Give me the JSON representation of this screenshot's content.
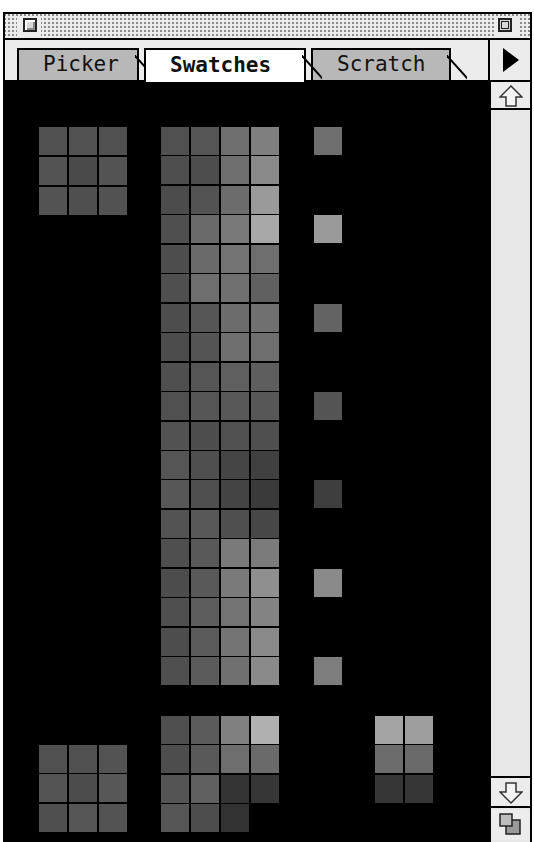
{
  "window": {
    "tabs": [
      {
        "label": "Picker",
        "active": false
      },
      {
        "label": "Swatches",
        "active": true
      },
      {
        "label": "Scratch",
        "active": false
      }
    ],
    "icons": {
      "close": "close-box-icon",
      "zoom": "zoom-box-icon",
      "menu": "triangle-right-icon",
      "scroll_up": "arrow-up-icon",
      "scroll_down": "arrow-down-icon",
      "grow": "grow-box-icon"
    }
  },
  "colors": {
    "background": "#000000",
    "chrome": "#ececec",
    "tab_inactive": "#b8b8b8",
    "tab_active": "#ffffff"
  },
  "swatches": {
    "cell_size": 28,
    "top_left_grid": {
      "x": 34,
      "y": 45,
      "pitch_x": 30,
      "pitch_y": 30,
      "rows": [
        [
          "#505050",
          "#525252",
          "#505050"
        ],
        [
          "#535353",
          "#4a4a4a",
          "#535353"
        ],
        [
          "#535353",
          "#4f4f4f",
          "#525252"
        ]
      ]
    },
    "main_grid": {
      "x": 156,
      "y": 45,
      "pitch_x": 30,
      "pitch_y": 29.45,
      "rows": [
        [
          "#505050",
          "#555555",
          "#6e6e6e",
          "#7f7f7f"
        ],
        [
          "#4e4e4e",
          "#4d4d4d",
          "#6e6e6e",
          "#8a8a8a"
        ],
        [
          "#4c4c4c",
          "#535353",
          "#6c6c6c",
          "#9a9a9a"
        ],
        [
          "#4f4f4f",
          "#6a6a6a",
          "#797979",
          "#a8a8a8"
        ],
        [
          "#4d4d4d",
          "#6a6a6a",
          "#737373",
          "#6e6e6e"
        ],
        [
          "#4f4f4f",
          "#6e6e6e",
          "#707070",
          "#606060"
        ],
        [
          "#4d4d4d",
          "#555555",
          "#6c6c6c",
          "#707070"
        ],
        [
          "#4c4c4c",
          "#545454",
          "#6f6f6f",
          "#6e6e6e"
        ],
        [
          "#4f4f4f",
          "#555555",
          "#5f5f5f",
          "#5e5e5e"
        ],
        [
          "#505050",
          "#565656",
          "#585858",
          "#575757"
        ],
        [
          "#525252",
          "#4d4d4d",
          "#505050",
          "#4f4f4f"
        ],
        [
          "#555555",
          "#4f4f4f",
          "#454545",
          "#404040"
        ],
        [
          "#575757",
          "#4f4f4f",
          "#444444",
          "#3a3a3a"
        ],
        [
          "#535353",
          "#585858",
          "#4f4f4f",
          "#474747"
        ],
        [
          "#4f4f4f",
          "#595959",
          "#7a7a7a",
          "#7b7b7b"
        ],
        [
          "#4c4c4c",
          "#595959",
          "#7a7a7a",
          "#8f8f8f"
        ],
        [
          "#4f4f4f",
          "#5d5d5d",
          "#737373",
          "#838383"
        ],
        [
          "#4d4d4d",
          "#5a5a5a",
          "#747474",
          "#8a8a8a"
        ],
        [
          "#4f4f4f",
          "#5b5b5b",
          "#707070",
          "#8a8a8a"
        ]
      ]
    },
    "single_column": {
      "x": 309,
      "items": [
        {
          "row": 0,
          "color": "#6e6e6e"
        },
        {
          "row": 3,
          "color": "#9a9a9a"
        },
        {
          "row": 6,
          "color": "#636363"
        },
        {
          "row": 9,
          "color": "#545454"
        },
        {
          "row": 12,
          "color": "#3e3e3e"
        },
        {
          "row": 15,
          "color": "#8a8a8a"
        },
        {
          "row": 18,
          "color": "#7d7d7d"
        }
      ]
    },
    "bottom_grid": {
      "x": 156,
      "y": 634,
      "pitch_x": 30,
      "pitch_y": 29.45,
      "rows": [
        [
          "#4f4f4f",
          "#5b5b5b",
          "#808080",
          "#b0b0b0"
        ],
        [
          "#4d4d4d",
          "#595959",
          "#6e6e6e",
          "#6a6a6a"
        ],
        [
          "#545454",
          "#5f5f5f",
          "#343434",
          "#363636"
        ],
        [
          "#565656",
          "#4d4d4d",
          "#323232"
        ]
      ]
    },
    "bottom_left_grid": {
      "x": 34,
      "y": 663,
      "pitch_x": 30,
      "pitch_y": 29.45,
      "rows": [
        [
          "#505050",
          "#505050",
          "#535353"
        ],
        [
          "#545454",
          "#4c4c4c",
          "#575757"
        ],
        [
          "#4f4f4f",
          "#555555",
          "#535353"
        ]
      ]
    },
    "bottom_right_grid": {
      "x": 370,
      "y": 634,
      "pitch_x": 30,
      "pitch_y": 29.45,
      "rows": [
        [
          "#a4a4a4",
          "#9e9e9e"
        ],
        [
          "#6c6c6c",
          "#696969"
        ],
        [
          "#363636",
          "#363636"
        ]
      ]
    }
  }
}
